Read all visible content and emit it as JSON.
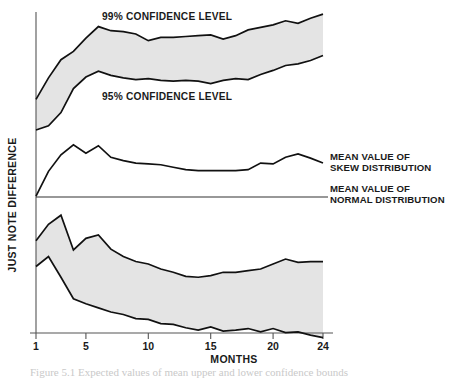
{
  "figure": {
    "background": "#ffffff",
    "line_color": "#111111",
    "band_fill_color": "#e4e4e4",
    "axis_color": "#555555"
  },
  "labels": {
    "y_axis_title": "JUST NOTE DIFFERENCE",
    "x_axis_title": "MONTHS",
    "band_upper": "99% CONFIDENCE LEVEL",
    "band_lower": "95% CONFIDENCE LEVEL",
    "callout_skew_line1": "MEAN VALUE OF",
    "callout_skew_line2": "SKEW DISTRIBUTION",
    "callout_normal_line1": "MEAN VALUE OF",
    "callout_normal_line2": "NORMAL DISTRIBUTION",
    "caption": "Figure 5.1 Expected values of mean upper and lower confidence bounds"
  },
  "axis": {
    "x_ticks": [
      1,
      5,
      10,
      15,
      20,
      24
    ],
    "x_tick_labels": [
      "1",
      "5",
      "10",
      "15",
      "20",
      "24"
    ],
    "x_min": 1,
    "x_max": 24,
    "y_zero_label": "0",
    "grid": false
  },
  "chart_data": {
    "type": "area",
    "title": "",
    "subtitle": "",
    "xlabel": "MONTHS",
    "ylabel": "JUST NOTE DIFFERENCE",
    "xlim": [
      1,
      24
    ],
    "ylim": [
      -4.4,
      4.4
    ],
    "grid": false,
    "legend": "inline-annotations",
    "x": [
      1,
      2,
      3,
      4,
      5,
      6,
      7,
      8,
      9,
      10,
      11,
      12,
      13,
      14,
      15,
      16,
      17,
      18,
      19,
      20,
      21,
      22,
      23,
      24
    ],
    "series": [
      {
        "name": "Upper 99% confidence bound",
        "label": "99% CONFIDENCE LEVEL",
        "role": "upper-band-top",
        "values": [
          2.36,
          2.88,
          3.32,
          3.52,
          3.84,
          4.12,
          4.02,
          4.0,
          3.94,
          3.78,
          3.86,
          3.86,
          3.88,
          3.9,
          3.92,
          3.82,
          3.9,
          4.04,
          4.1,
          4.16,
          4.26,
          4.2,
          4.32,
          4.42
        ]
      },
      {
        "name": "Upper 95% confidence bound",
        "label": "95% CONFIDENCE LEVEL",
        "role": "upper-band-bottom",
        "values": [
          1.62,
          1.72,
          2.04,
          2.62,
          2.9,
          3.04,
          2.94,
          2.88,
          2.84,
          2.86,
          2.82,
          2.8,
          2.82,
          2.8,
          2.74,
          2.82,
          2.86,
          2.84,
          2.96,
          3.06,
          3.18,
          3.22,
          3.3,
          3.42
        ]
      },
      {
        "name": "Mean value of skew distribution",
        "label": "MEAN VALUE OF SKEW DISTRIBUTION",
        "role": "skew-mean-line",
        "values": [
          0.02,
          0.62,
          1.02,
          1.26,
          1.06,
          1.24,
          0.96,
          0.88,
          0.82,
          0.8,
          0.78,
          0.72,
          0.66,
          0.64,
          0.64,
          0.64,
          0.64,
          0.66,
          0.82,
          0.8,
          0.96,
          1.04,
          0.94,
          0.82
        ]
      },
      {
        "name": "Mean value of normal distribution",
        "label": "MEAN VALUE OF NORMAL DISTRIBUTION",
        "role": "normal-mean-baseline",
        "values": [
          0,
          0,
          0,
          0,
          0,
          0,
          0,
          0,
          0,
          0,
          0,
          0,
          0,
          0,
          0,
          0,
          0,
          0,
          0,
          0,
          0,
          0,
          0,
          0
        ]
      },
      {
        "name": "Lower 95% confidence bound",
        "role": "lower-band-top",
        "values": [
          -1.06,
          -0.66,
          -0.44,
          -1.28,
          -1.0,
          -0.92,
          -1.26,
          -1.44,
          -1.56,
          -1.62,
          -1.74,
          -1.82,
          -1.92,
          -1.94,
          -1.9,
          -1.82,
          -1.82,
          -1.78,
          -1.74,
          -1.62,
          -1.5,
          -1.58,
          -1.56,
          -1.56
        ]
      },
      {
        "name": "Lower 99% confidence bound",
        "role": "lower-band-bottom",
        "values": [
          -1.68,
          -1.44,
          -1.94,
          -2.46,
          -2.58,
          -2.68,
          -2.78,
          -2.84,
          -2.94,
          -2.96,
          -3.06,
          -3.08,
          -3.16,
          -3.22,
          -3.14,
          -3.24,
          -3.22,
          -3.18,
          -3.26,
          -3.18,
          -3.28,
          -3.26,
          -3.34,
          -3.4
        ]
      }
    ]
  }
}
